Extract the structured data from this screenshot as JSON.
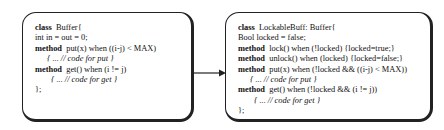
{
  "left_box": {
    "lines": [
      {
        "kw": "class",
        "text": "  Buffer{"
      },
      {
        "kw": "",
        "text": "int in = out = 0;"
      },
      {
        "kw": "method",
        "text": "  put(x) when ((i-j) < MAX)"
      },
      {
        "kw": "",
        "text": "{ ... // code for put }",
        "comment": true
      },
      {
        "kw": "method",
        "text": "  get() when (i != j)"
      },
      {
        "kw": "",
        "text": "{ ... // code for get }",
        "comment": true
      },
      {
        "kw": "",
        "text": "};"
      }
    ]
  },
  "arrow": {
    "label": "",
    "direction": "left-to-right"
  },
  "right_box": {
    "lines": [
      {
        "kw": "class",
        "text": "  LockableBuff: Buffer{"
      },
      {
        "kw": "",
        "text": "Bool locked = false;"
      },
      {
        "kw": "method",
        "text": "  lock() when (!locked) {locked=true;}"
      },
      {
        "kw": "method",
        "text": "  unlock() when (locked) {locked=false;}"
      },
      {
        "kw": "method",
        "text": "  put(x) when (!locked && ((i-j) < MAX))"
      },
      {
        "kw": "",
        "text": "{ ... // code for put }",
        "comment": true
      },
      {
        "kw": "method",
        "text": "  get() when (!locked && (i != j))"
      },
      {
        "kw": "",
        "text": "{ ... // code for get }",
        "comment": true
      },
      {
        "kw": "",
        "text": "};"
      }
    ]
  }
}
